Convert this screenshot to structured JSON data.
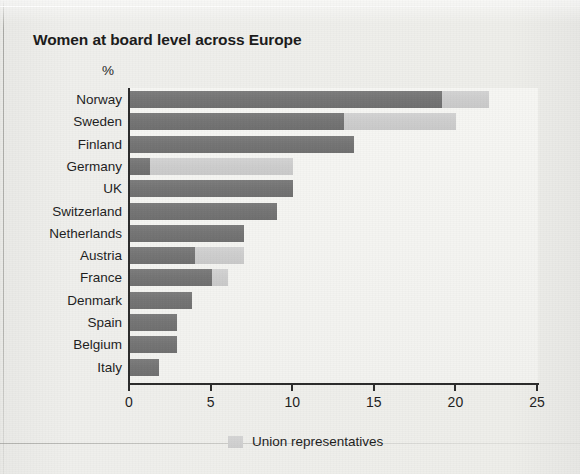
{
  "chart_data": {
    "type": "bar",
    "orientation": "horizontal",
    "stacked": true,
    "title": "Women at board level across Europe",
    "unit_label": "%",
    "xlabel": "",
    "ylabel": "",
    "xlim": [
      0,
      25
    ],
    "xticks": [
      0,
      5,
      10,
      15,
      20,
      25
    ],
    "xtick_labels": [
      "0",
      "5",
      "10",
      "15",
      "20",
      "25"
    ],
    "grid": false,
    "legend": {
      "position": "bottom",
      "entries": [
        {
          "name": "Union representatives",
          "color": "#cdcdcd"
        }
      ]
    },
    "series": [
      {
        "name": "Women on boards",
        "color": "#747474",
        "values": [
          19.1,
          13.1,
          13.7,
          1.2,
          10.0,
          9.0,
          7.0,
          4.0,
          5.0,
          3.8,
          2.9,
          2.9,
          1.8
        ]
      },
      {
        "name": "Union representatives",
        "color": "#cdcdcd",
        "values": [
          2.9,
          6.9,
          0,
          8.8,
          0,
          0,
          0,
          3.0,
          1.0,
          0,
          0,
          0,
          0
        ]
      }
    ],
    "categories": [
      "Norway",
      "Sweden",
      "Finland",
      "Germany",
      "UK",
      "Switzerland",
      "Netherlands",
      "Austria",
      "France",
      "Denmark",
      "Spain",
      "Belgium",
      "Italy"
    ],
    "totals": [
      22.0,
      20.0,
      13.7,
      10.0,
      10.0,
      9.0,
      7.0,
      7.0,
      6.0,
      3.8,
      2.9,
      2.9,
      1.8
    ]
  }
}
